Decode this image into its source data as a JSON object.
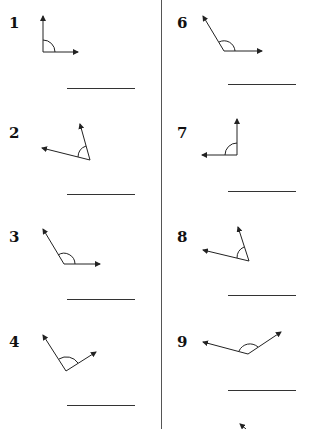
{
  "worksheet": {
    "items": [
      {
        "number": "1",
        "answer": ""
      },
      {
        "number": "2",
        "answer": ""
      },
      {
        "number": "3",
        "answer": ""
      },
      {
        "number": "4",
        "answer": ""
      },
      {
        "number": "6",
        "answer": ""
      },
      {
        "number": "7",
        "answer": ""
      },
      {
        "number": "8",
        "answer": ""
      },
      {
        "number": "9",
        "answer": ""
      }
    ]
  }
}
